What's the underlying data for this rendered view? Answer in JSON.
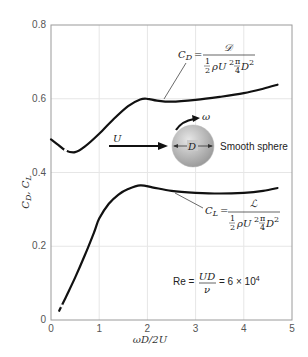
{
  "chart_data": {
    "type": "line",
    "title": "",
    "xlabel": "ωD/2U",
    "ylabel": "C_D, C_L",
    "xlim": [
      0,
      5
    ],
    "ylim": [
      0,
      0.8
    ],
    "xticks": [
      0,
      1,
      2,
      3,
      4,
      5
    ],
    "yticks": [
      0,
      0.2,
      0.4,
      0.6,
      0.8
    ],
    "xtick_labels": [
      "0",
      "1",
      "2",
      "3",
      "4",
      "5"
    ],
    "ytick_labels": [
      "0",
      "0.2",
      "0.4",
      "0.6",
      "0.8"
    ],
    "grid": true,
    "series": [
      {
        "name": "C_D",
        "x": [
          0.0,
          0.15,
          0.3,
          0.5,
          0.7,
          1.0,
          1.3,
          1.6,
          1.85,
          2.0,
          2.2,
          2.5,
          3.0,
          3.5,
          4.0,
          4.4,
          4.7
        ],
        "values": [
          0.49,
          0.475,
          0.46,
          0.455,
          0.47,
          0.505,
          0.545,
          0.58,
          0.598,
          0.6,
          0.595,
          0.592,
          0.597,
          0.605,
          0.615,
          0.627,
          0.638
        ],
        "dashed_segment_x": [
          0.25,
          0.35
        ]
      },
      {
        "name": "C_L",
        "x": [
          0.17,
          0.3,
          0.5,
          0.7,
          0.9,
          1.0,
          1.2,
          1.4,
          1.6,
          1.85,
          2.1,
          2.5,
          3.0,
          3.5,
          4.0,
          4.4,
          4.7
        ],
        "values": [
          0.025,
          0.06,
          0.115,
          0.175,
          0.24,
          0.275,
          0.315,
          0.34,
          0.355,
          0.365,
          0.36,
          0.35,
          0.345,
          0.343,
          0.345,
          0.35,
          0.358
        ],
        "dashed_segment_x": [
          0.17,
          0.27
        ]
      }
    ],
    "annotations": [
      {
        "label": "C_D = 𝒟 / (½ρU²(π/4)D²)",
        "target_series": "C_D"
      },
      {
        "label": "C_L = ℒ / (½ρU²(π/4)D²)",
        "target_series": "C_L"
      },
      {
        "label": "Re = UD/ν = 6 × 10⁴"
      },
      {
        "label": "Smooth sphere"
      },
      {
        "label": "U"
      },
      {
        "label": "ω"
      },
      {
        "label": "D"
      }
    ]
  },
  "labels": {
    "x_axis": "ωD/2U",
    "y_axis_cd": "C",
    "y_axis_cd_sub": "D",
    "y_axis_sep": ", ",
    "y_axis_cl": "C",
    "y_axis_cl_sub": "L",
    "ticks_x": [
      "0",
      "1",
      "2",
      "3",
      "4",
      "5"
    ],
    "ticks_y": [
      "0",
      "0.2",
      "0.4",
      "0.6",
      "0.8"
    ],
    "cd_eq": {
      "lhs": "C",
      "lhs_sub": "D",
      "equals": "=",
      "numerator": "𝒟",
      "den_half_num": "1",
      "den_half_den": "2",
      "den_rho": "ρU",
      "den_sq": "2",
      "den_pi": "π",
      "den_four": "4",
      "den_d": "D",
      "den_d_sq": "2"
    },
    "cl_eq": {
      "lhs": "C",
      "lhs_sub": "L",
      "equals": "=",
      "numerator": "ℒ",
      "den_half_num": "1",
      "den_half_den": "2",
      "den_rho": "ρU",
      "den_sq": "2",
      "den_pi": "π",
      "den_four": "4",
      "den_d": "D",
      "den_d_sq": "2"
    },
    "re_eq": {
      "lhs": "Re =",
      "num": "UD",
      "den": "ν",
      "rhs": "= 6 × 10",
      "exp": "4"
    },
    "sphere": {
      "label": "Smooth sphere",
      "flow": "U",
      "spin": "ω",
      "diameter": "D"
    }
  },
  "colors": {
    "curve": "#111111",
    "sphere_light": "#e0e0e0",
    "sphere_dark": "#9c9c9c",
    "grid": "#e6e6e6",
    "frame": "#9a9a9a"
  }
}
